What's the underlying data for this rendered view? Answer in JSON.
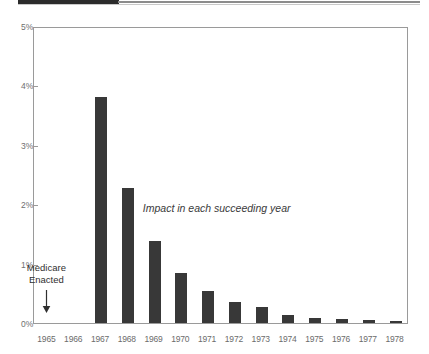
{
  "chart_data": {
    "type": "bar",
    "title": "",
    "subtitle": "",
    "xlabel": "",
    "ylabel": "",
    "categories": [
      "1965",
      "1966",
      "1967",
      "1968",
      "1969",
      "1970",
      "1971",
      "1972",
      "1973",
      "1974",
      "1975",
      "1976",
      "1977",
      "1978"
    ],
    "values": [
      0,
      0,
      3.8,
      2.27,
      1.38,
      0.84,
      0.54,
      0.35,
      0.27,
      0.14,
      0.09,
      0.07,
      0.05,
      0.04
    ],
    "ylim": [
      0,
      5
    ],
    "ytick_values": [
      0,
      1,
      2,
      3,
      4,
      5
    ],
    "ytick_labels": [
      "0%",
      "1%",
      "2%",
      "3%",
      "4%",
      "5%"
    ],
    "grid": false,
    "legend": "none",
    "bar_color": "#383838",
    "axis_color": "#9a9a9a",
    "annotations": [
      {
        "name": "impact-note",
        "text": "Impact in each succeeding year",
        "style": "italic"
      },
      {
        "name": "medicare-enacted",
        "line1": "Medicare",
        "line2": "Enacted",
        "points_to_category": "1965",
        "marker": "down-arrow"
      }
    ]
  },
  "page": {
    "background_color": "#ffffff",
    "top_block_color": "#2b2b2b"
  }
}
